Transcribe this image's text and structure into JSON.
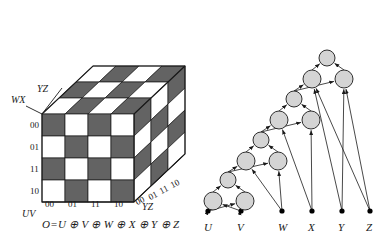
{
  "cube": {
    "axis_labels": {
      "vertical": "WX",
      "depth": "YZ",
      "horizontal": "UV",
      "depth_bottom": "YZ"
    },
    "row_ticks": [
      "00",
      "01",
      "11",
      "10"
    ],
    "col_ticks": [
      "00",
      "01",
      "11",
      "10"
    ],
    "depth_ticks": [
      "00",
      "01",
      "11",
      "10"
    ],
    "formula": "O=U ⊕ V ⊕ W ⊕ X ⊕ Y ⊕ Z",
    "colors": {
      "dark_cell": "#636363",
      "light_cell": "#ffffff",
      "edge": "#1a1a1a"
    },
    "front_face": [
      [
        1,
        0,
        1,
        0
      ],
      [
        0,
        1,
        0,
        1
      ],
      [
        1,
        0,
        1,
        0
      ],
      [
        0,
        1,
        0,
        1
      ]
    ],
    "top_face": [
      [
        0,
        1,
        0,
        1
      ],
      [
        1,
        0,
        1,
        0
      ],
      [
        0,
        1,
        0,
        1
      ]
    ],
    "right_face": [
      [
        1,
        0,
        1
      ],
      [
        0,
        1,
        0
      ],
      [
        1,
        0,
        1
      ],
      [
        0,
        1,
        0
      ]
    ]
  },
  "tree": {
    "inputs": [
      "U",
      "V",
      "W",
      "X",
      "Y",
      "Z"
    ],
    "node_count": 11,
    "colors": {
      "node_fill": "#d4d4d4",
      "node_stroke": "#1a1a1a",
      "edge": "#1a1a1a",
      "terminal": "#000000"
    },
    "nodes": [
      {
        "id": "n0",
        "cx": 213,
        "cy": 201,
        "r": 9
      },
      {
        "id": "n1",
        "cx": 245,
        "cy": 201,
        "r": 9
      },
      {
        "id": "n2",
        "cx": 228,
        "cy": 180,
        "r": 8
      },
      {
        "id": "n3",
        "cx": 246,
        "cy": 161,
        "r": 9
      },
      {
        "id": "n4",
        "cx": 278,
        "cy": 161,
        "r": 9
      },
      {
        "id": "n5",
        "cx": 261,
        "cy": 140,
        "r": 8
      },
      {
        "id": "n6",
        "cx": 279,
        "cy": 120,
        "r": 9
      },
      {
        "id": "n7",
        "cx": 311,
        "cy": 120,
        "r": 9
      },
      {
        "id": "n8",
        "cx": 294,
        "cy": 99,
        "r": 8
      },
      {
        "id": "n9",
        "cx": 312,
        "cy": 79,
        "r": 9
      },
      {
        "id": "n10",
        "cx": 344,
        "cy": 79,
        "r": 9
      },
      {
        "id": "n11",
        "cx": 327,
        "cy": 58,
        "r": 8
      }
    ],
    "terminals": [
      {
        "label": "U",
        "x": 208,
        "y": 222
      },
      {
        "label": "V",
        "x": 241,
        "y": 222
      },
      {
        "label": "W",
        "x": 282,
        "y": 222
      },
      {
        "label": "X",
        "x": 312,
        "y": 222
      },
      {
        "label": "Y",
        "x": 342,
        "y": 222
      },
      {
        "label": "Z",
        "x": 370,
        "y": 222
      }
    ]
  }
}
